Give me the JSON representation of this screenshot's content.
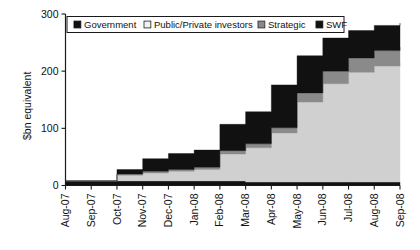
{
  "chart_data": {
    "type": "area",
    "title": "",
    "subtitle": "",
    "xlabel": "",
    "ylabel": "$bn equivalent",
    "ylim": [
      0,
      300
    ],
    "yticks": [
      0,
      100,
      200,
      300
    ],
    "grid": false,
    "stacked": true,
    "step": true,
    "legend_position": "top-center",
    "legend_entries": [
      {
        "label": "Government",
        "color": "#111111",
        "swatch": "filled-dark"
      },
      {
        "label": "Public/Private investors",
        "color": "#d0d0d0",
        "swatch": "filled-light"
      },
      {
        "label": "Strategic",
        "color": "#8a8a8a",
        "swatch": "filled-mid"
      },
      {
        "label": "SWF",
        "color": "#111111",
        "swatch": "filled-dark"
      }
    ],
    "categories": [
      "Aug-07",
      "Sep-07",
      "Oct-07",
      "Nov-07",
      "Dec-07",
      "Jan-08",
      "Feb-08",
      "Mar-08",
      "Apr-08",
      "May-08",
      "Jun-08",
      "Jul-08",
      "Aug-08",
      "Sep-08"
    ],
    "x": [
      "Aug-07",
      "Sep-07",
      "Oct-07",
      "Nov-07",
      "Dec-07",
      "Jan-08",
      "Feb-08",
      "Mar-08",
      "Apr-08",
      "May-08",
      "Jun-08",
      "Jul-08",
      "Aug-08",
      "Sep-08"
    ],
    "series": [
      {
        "name": "SWF",
        "color": "#111111",
        "stack_order": 1,
        "values": [
          8,
          8,
          8,
          8,
          8,
          8,
          8,
          6,
          6,
          6,
          6,
          6,
          6,
          6
        ]
      },
      {
        "name": "Public/Private investors",
        "color": "#d0d0d0",
        "stack_order": 2,
        "values": [
          0,
          0,
          10,
          14,
          17,
          20,
          47,
          60,
          86,
          140,
          172,
          192,
          203,
          208
        ]
      },
      {
        "name": "Strategic",
        "color": "#8a8a8a",
        "stack_order": 3,
        "values": [
          0,
          0,
          2,
          3,
          3,
          4,
          6,
          7,
          9,
          16,
          22,
          25,
          27,
          28
        ]
      },
      {
        "name": "Government",
        "color": "#111111",
        "stack_order": 4,
        "values": [
          0,
          0,
          8,
          22,
          28,
          30,
          46,
          56,
          75,
          65,
          58,
          48,
          44,
          42
        ]
      }
    ],
    "cumulative_totals": [
      8,
      8,
      28,
      47,
      56,
      62,
      107,
      129,
      176,
      227,
      258,
      271,
      280,
      284
    ],
    "annotations": []
  },
  "axes": {
    "y_tick_labels": [
      "300",
      "200",
      "100",
      "0"
    ],
    "y_axis_title": "$bn equivalent",
    "x_tick_labels": [
      "Aug-07",
      "Sep-07",
      "Oct-07",
      "Nov-07",
      "Dec-07",
      "Jan-08",
      "Feb-08",
      "Mar-08",
      "Apr-08",
      "May-08",
      "Jun-08",
      "Jul-08",
      "Aug-08",
      "Sep-08"
    ]
  },
  "legend": {
    "items": [
      {
        "label": "Government",
        "swatch_fill": "#111111",
        "swatch_stroke": "#111111"
      },
      {
        "label": "Public/Private investors",
        "swatch_fill": "#f2f2f2",
        "swatch_stroke": "#333333"
      },
      {
        "label": "Strategic",
        "swatch_fill": "#8a8a8a",
        "swatch_stroke": "#333333"
      },
      {
        "label": "SWF",
        "swatch_fill": "#111111",
        "swatch_stroke": "#111111"
      }
    ]
  },
  "colors": {
    "government": "#111111",
    "public_private": "#d0d0d0",
    "strategic": "#8a8a8a",
    "swf": "#111111",
    "axis": "#1a1a1a",
    "background": "#ffffff"
  }
}
